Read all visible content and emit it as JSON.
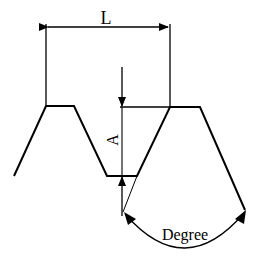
{
  "diagram": {
    "labels": {
      "pitch": "L",
      "depth": "A",
      "angle": "Degree"
    },
    "colors": {
      "stroke": "#000000",
      "background": "#ffffff"
    }
  }
}
